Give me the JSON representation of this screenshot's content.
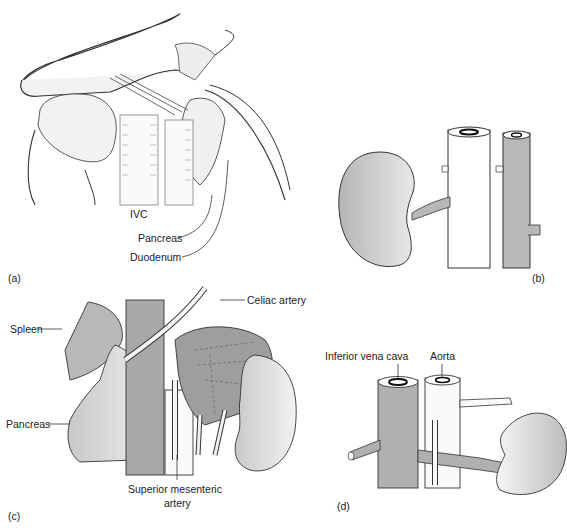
{
  "figure": {
    "panels": [
      {
        "id": "a",
        "tag": "(a)",
        "labels": [
          "IVC",
          "Pancreas",
          "Duodenum"
        ]
      },
      {
        "id": "b",
        "tag": "(b)",
        "labels": []
      },
      {
        "id": "c",
        "tag": "(c)",
        "labels": [
          "Spleen",
          "Celiac artery",
          "Pancreas",
          "Superior mesenteric",
          "artery"
        ]
      },
      {
        "id": "d",
        "tag": "(d)",
        "labels": [
          "Inferior vena cava",
          "Aorta"
        ]
      }
    ]
  },
  "colors": {
    "organ_gray": "#b8b8b8",
    "light_gray": "#d6d6d6",
    "dark_gray": "#9a9a9a",
    "line": "#333333"
  }
}
